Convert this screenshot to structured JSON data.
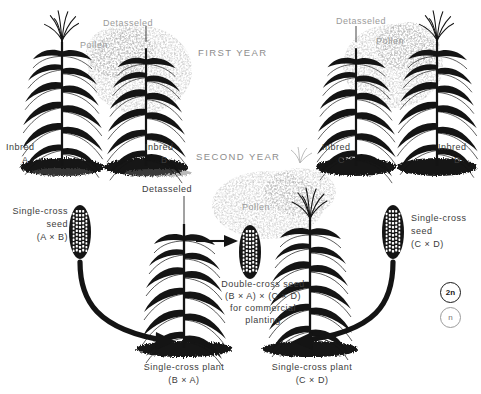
{
  "figure": {
    "background_color": "#ffffff",
    "ink_color": "#111111",
    "label_color": "#3c3c3c",
    "faded_label_color": "#9a9a9a"
  },
  "stages": {
    "first_year": "FIRST YEAR",
    "second_year": "SECOND YEAR"
  },
  "first_year": {
    "left_pair": {
      "detasseled_label": "Detasseled",
      "pollen_label": "Pollen",
      "female_parent": {
        "line1": "Inbred",
        "line2": "A"
      },
      "male_parent": {
        "line1": "Inbred",
        "line2": "B"
      },
      "seed_label": {
        "line1": "Single-cross",
        "line2": "seed",
        "line3": "(A × B)"
      }
    },
    "right_pair": {
      "detasseled_label": "Detasseled",
      "pollen_label": "Pollen",
      "female_parent": {
        "line1": "Inbred",
        "line2": "C"
      },
      "male_parent": {
        "line1": "Inbred",
        "line2": "D"
      },
      "seed_label": {
        "line1": "Single-cross",
        "line2": "seed",
        "line3": "(C × D)"
      }
    }
  },
  "second_year": {
    "detasseled_label": "Detasseled",
    "pollen_label": "Pollen",
    "female_plant": {
      "line1": "Single-cross plant",
      "line2": "(B × A)"
    },
    "male_plant": {
      "line1": "Single-cross plant",
      "line2": "(C × D)"
    },
    "product_label": {
      "line1": "Double-cross seed",
      "line2": "(B × A) × (C × D)",
      "line3": "for commercial",
      "line4": "planting"
    }
  },
  "legend": {
    "diploid": "2n",
    "haploid": "n"
  }
}
